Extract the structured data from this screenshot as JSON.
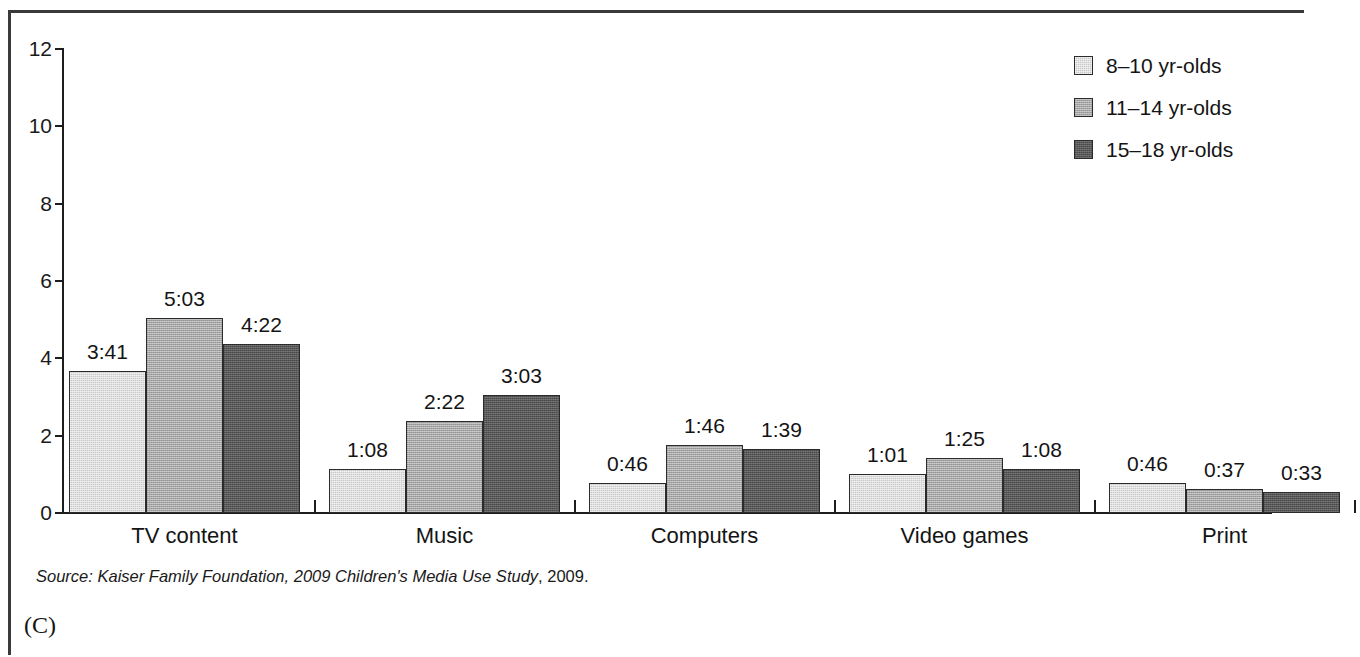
{
  "panel": {
    "letter": "(C)"
  },
  "source": {
    "italic_part": "Source: Kaiser Family Foundation, 2009 Children's Media Use Study",
    "plain_part": ", 2009."
  },
  "legend": {
    "items": [
      {
        "label": "8–10 yr-olds",
        "swatch": "light-gray-swatch",
        "color": "#c8c8c8"
      },
      {
        "label": "11–14 yr-olds",
        "swatch": "medium-gray-swatch",
        "color": "#a6a6a6"
      },
      {
        "label": "15–18 yr-olds",
        "swatch": "dark-gray-swatch",
        "color": "#585858"
      }
    ]
  },
  "axis": {
    "y_ticks": [
      "12",
      "10",
      "8",
      "6",
      "4",
      "2",
      "0"
    ]
  },
  "chart_data": {
    "type": "bar",
    "title": "",
    "xlabel": "",
    "ylabel": "",
    "ylim": [
      0,
      12
    ],
    "yticks": [
      0,
      2,
      4,
      6,
      8,
      10,
      12
    ],
    "grid": false,
    "legend_position": "top-right",
    "categories": [
      "TV content",
      "Music",
      "Computers",
      "Video games",
      "Print"
    ],
    "series": [
      {
        "name": "8–10 yr-olds",
        "color": "#c8c8c8",
        "values": [
          3.683,
          1.133,
          0.767,
          1.017,
          0.767
        ],
        "labels": [
          "3:41",
          "1:08",
          "0:46",
          "1:01",
          "0:46"
        ]
      },
      {
        "name": "11–14 yr-olds",
        "color": "#a6a6a6",
        "values": [
          5.05,
          2.367,
          1.767,
          1.417,
          0.617
        ],
        "labels": [
          "5:03",
          "2:22",
          "1:46",
          "1:25",
          "0:37"
        ]
      },
      {
        "name": "15–18 yr-olds",
        "color": "#585858",
        "values": [
          4.367,
          3.05,
          1.65,
          1.133,
          0.55
        ],
        "labels": [
          "4:22",
          "3:03",
          "1:39",
          "1:08",
          "0:33"
        ]
      }
    ]
  }
}
